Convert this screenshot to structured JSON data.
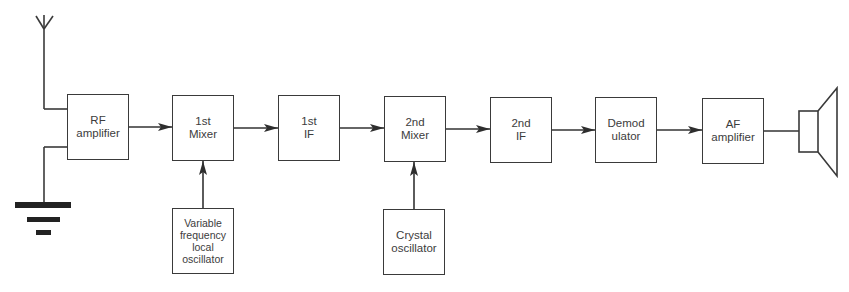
{
  "diagram": {
    "type": "block-diagram",
    "colors": {
      "line": "#333333",
      "text": "#3c3c3c",
      "background": "#ffffff"
    },
    "blocks": [
      {
        "id": "rf_amp",
        "lines": [
          "RF",
          "amplifier"
        ],
        "x": 67,
        "y": 94,
        "w": 62,
        "h": 66
      },
      {
        "id": "mixer1",
        "lines": [
          "1st",
          "Mixer"
        ],
        "x": 172,
        "y": 95,
        "w": 62,
        "h": 66
      },
      {
        "id": "if1",
        "lines": [
          "1st",
          "IF"
        ],
        "x": 278,
        "y": 95,
        "w": 62,
        "h": 66
      },
      {
        "id": "mixer2",
        "lines": [
          "2nd",
          "Mixer"
        ],
        "x": 384,
        "y": 96,
        "w": 62,
        "h": 66
      },
      {
        "id": "if2",
        "lines": [
          "2nd",
          "IF"
        ],
        "x": 490,
        "y": 97,
        "w": 62,
        "h": 66
      },
      {
        "id": "demod",
        "lines": [
          "Demod",
          "ulator"
        ],
        "x": 595,
        "y": 97,
        "w": 62,
        "h": 66
      },
      {
        "id": "af_amp",
        "lines": [
          "AF",
          "amplifier"
        ],
        "x": 702,
        "y": 98,
        "w": 62,
        "h": 66
      },
      {
        "id": "vfo",
        "lines": [
          "Variable",
          "frequency",
          "local",
          "oscillator"
        ],
        "x": 172,
        "y": 208,
        "w": 62,
        "h": 66
      },
      {
        "id": "xtal",
        "lines": [
          "Crystal",
          "oscillator"
        ],
        "x": 383,
        "y": 209,
        "w": 62,
        "h": 66
      }
    ],
    "connections": [
      {
        "from": "rf_amp",
        "to": "mixer1",
        "arrow": true
      },
      {
        "from": "mixer1",
        "to": "if1",
        "arrow": true
      },
      {
        "from": "if1",
        "to": "mixer2",
        "arrow": true
      },
      {
        "from": "mixer2",
        "to": "if2",
        "arrow": true
      },
      {
        "from": "if2",
        "to": "demod",
        "arrow": true
      },
      {
        "from": "demod",
        "to": "af_amp",
        "arrow": true
      },
      {
        "from": "af_amp",
        "to": "speaker",
        "arrow": false
      },
      {
        "from": "vfo",
        "to": "mixer1",
        "arrow": true
      },
      {
        "from": "xtal",
        "to": "mixer2",
        "arrow": true
      },
      {
        "from": "antenna",
        "to": "rf_amp",
        "arrow": false
      },
      {
        "from": "ground",
        "to": "rf_amp",
        "arrow": false
      }
    ],
    "symbols": [
      "antenna",
      "ground",
      "loudspeaker"
    ]
  }
}
